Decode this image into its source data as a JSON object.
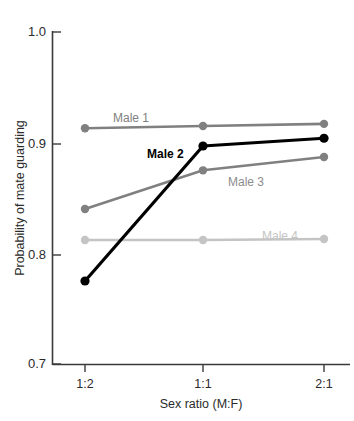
{
  "chart_data": {
    "type": "line",
    "title": "",
    "xlabel": "Sex ratio (M:F)",
    "ylabel": "Probability of mate guarding",
    "categories": [
      "1:2",
      "1:1",
      "2:1"
    ],
    "ylim": [
      0.7,
      1.0
    ],
    "yticks": [
      "1.0",
      "0.9",
      "0.8",
      "0.7"
    ],
    "ytick_values": [
      1.0,
      0.9,
      0.8,
      0.7
    ],
    "grid": false,
    "legend": "inline-labels",
    "series": [
      {
        "name": "Male 1",
        "color": "#808080",
        "values": [
          0.913,
          0.915,
          0.917
        ],
        "label": "Male 1",
        "label_color": "#808080"
      },
      {
        "name": "Male 2",
        "color": "#000000",
        "values": [
          0.775,
          0.897,
          0.904
        ],
        "label": "Male 2",
        "label_color": "#000000"
      },
      {
        "name": "Male 3",
        "color": "#808080",
        "values": [
          0.84,
          0.875,
          0.887
        ],
        "label": "Male 3",
        "label_color": "#8c8c8c"
      },
      {
        "name": "Male 4",
        "color": "#c4c4c4",
        "values": [
          0.812,
          0.812,
          0.813
        ],
        "label": "Male 4",
        "label_color": "#c4c4c4"
      }
    ]
  },
  "axes": {
    "y_tick_0": "1.0",
    "y_tick_1": "0.9",
    "y_tick_2": "0.8",
    "y_tick_3": "0.7",
    "x_tick_0": "1:2",
    "x_tick_1": "1:1",
    "x_tick_2": "2:1",
    "x_title": "Sex ratio (M:F)",
    "y_title": "Probability of mate guarding"
  },
  "labels": {
    "male1": "Male 1",
    "male2": "Male 2",
    "male3": "Male 3",
    "male4": "Male 4"
  },
  "colors": {
    "axis": "#3a3a3a",
    "male1": "#808080",
    "male2": "#000000",
    "male3": "#808080",
    "male4": "#c4c4c4",
    "male3_label": "#8c8c8c",
    "background": "#ffffff"
  }
}
